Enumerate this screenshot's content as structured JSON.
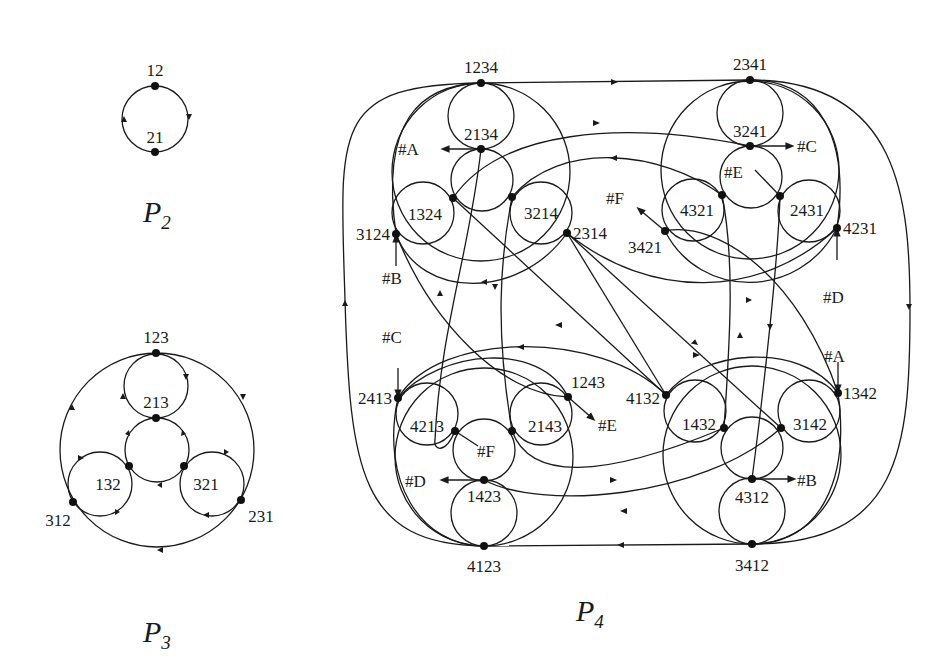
{
  "figures": {
    "p2": {
      "title": "P",
      "subscript": "2",
      "nodes": [
        "12",
        "21"
      ]
    },
    "p3": {
      "title": "P",
      "subscript": "3",
      "nodes": [
        "123",
        "213",
        "132",
        "321",
        "312",
        "231"
      ]
    },
    "p4": {
      "title": "P",
      "subscript": "4",
      "clusters": {
        "top_left": [
          "1234",
          "2134",
          "1324",
          "3214",
          "3124",
          "2314"
        ],
        "top_right": [
          "2341",
          "3241",
          "4321",
          "2431",
          "3421",
          "4231"
        ],
        "bottom_left": [
          "2413",
          "4213",
          "2143",
          "1243",
          "1423",
          "4123"
        ],
        "bottom_right": [
          "4132",
          "1432",
          "3142",
          "1342",
          "4312",
          "3412"
        ]
      },
      "markers": [
        "#A",
        "#B",
        "#C",
        "#D",
        "#E",
        "#F"
      ]
    }
  },
  "labels": {
    "n12": "12",
    "n21": "21",
    "n123": "123",
    "n213": "213",
    "n132": "132",
    "n321": "321",
    "n312": "312",
    "n231": "231",
    "n1234": "1234",
    "n2134": "2134",
    "n1324": "1324",
    "n3214": "3214",
    "n3124": "3124",
    "n2314": "2314",
    "n2341": "2341",
    "n3241": "3241",
    "n4321": "4321",
    "n2431": "2431",
    "n3421": "3421",
    "n4231": "4231",
    "n2413": "2413",
    "n4213": "4213",
    "n2143": "2143",
    "n1243": "1243",
    "n1423": "1423",
    "n4123": "4123",
    "n4132": "4132",
    "n1432": "1432",
    "n3142": "3142",
    "n1342": "1342",
    "n4312": "4312",
    "n3412": "3412",
    "mA": "#A",
    "mB": "#B",
    "mC": "#C",
    "mD": "#D",
    "mE": "#E",
    "mF": "#F"
  }
}
